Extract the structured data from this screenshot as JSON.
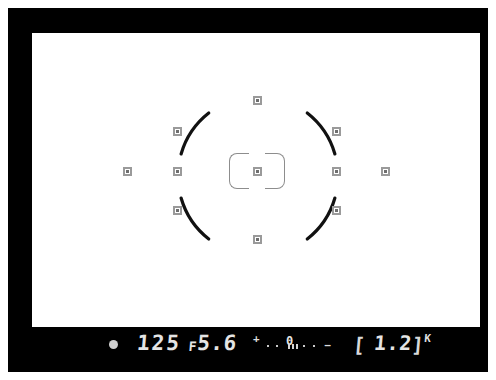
{
  "display": {
    "device_label": "camera-viewfinder",
    "frame_color": "#000000",
    "screen_color": "#ffffff",
    "lcd_text_color": "#e4e4e4",
    "af_point_color": "#9a9a9a"
  },
  "focus_screen": {
    "center_bracket_label": "center-af-bracket",
    "af_points": [
      {
        "id": "af-top",
        "x": 225,
        "y": 67,
        "selected": false
      },
      {
        "id": "af-upper-left",
        "x": 145,
        "y": 98,
        "selected": false
      },
      {
        "id": "af-upper-right",
        "x": 304,
        "y": 98,
        "selected": false
      },
      {
        "id": "af-far-left",
        "x": 95,
        "y": 138,
        "selected": false
      },
      {
        "id": "af-mid-left",
        "x": 145,
        "y": 138,
        "selected": false
      },
      {
        "id": "af-center",
        "x": 225,
        "y": 138,
        "selected": true
      },
      {
        "id": "af-mid-right",
        "x": 304,
        "y": 138,
        "selected": false
      },
      {
        "id": "af-far-right",
        "x": 353,
        "y": 138,
        "selected": false
      },
      {
        "id": "af-lower-left",
        "x": 145,
        "y": 177,
        "selected": false
      },
      {
        "id": "af-lower-right",
        "x": 304,
        "y": 177,
        "selected": false
      },
      {
        "id": "af-bottom",
        "x": 225,
        "y": 206,
        "selected": false
      }
    ],
    "metering_circle": {
      "center_x": 226,
      "center_y": 143,
      "radius": 80,
      "stroke_color": "#111111",
      "arcs": [
        {
          "id": "arc-top-left",
          "start_deg": 196,
          "end_deg": 232
        },
        {
          "id": "arc-top-right",
          "start_deg": 308,
          "end_deg": 344
        },
        {
          "id": "arc-bottom-right",
          "start_deg": 16,
          "end_deg": 52
        },
        {
          "id": "arc-bottom-left",
          "start_deg": 128,
          "end_deg": 164
        }
      ]
    }
  },
  "info_bar": {
    "focus_indicator": "●",
    "shutter_speed": "125",
    "aperture_prefix": "F",
    "aperture_value": "5.6",
    "exposure_scale": {
      "plus_sign": "+",
      "zero_label": "0",
      "minus_sign": "−",
      "dot_positions": [
        14,
        23,
        50,
        60
      ],
      "tick_positions": [
        35,
        39,
        43
      ]
    },
    "frame_counter": {
      "bracket_left": "[",
      "value": "1.2",
      "bracket_right": "]",
      "unit": "K"
    }
  }
}
